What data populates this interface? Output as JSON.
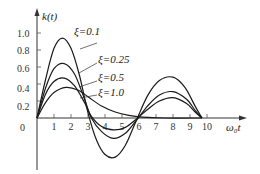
{
  "chart_data": {
    "type": "line",
    "title": "",
    "xlabel": "ω₀t",
    "ylabel": "k(t)",
    "xlim": [
      0,
      11.5
    ],
    "ylim": [
      -0.6,
      1.2
    ],
    "grid": false,
    "legend": "inline labels",
    "x_ticks": [
      "1",
      "2",
      "3",
      "4",
      "5",
      "6",
      "7",
      "8",
      "9",
      "10"
    ],
    "y_ticks": [
      "0.2",
      "0.4",
      "0.6",
      "0.8",
      "1.0"
    ],
    "origin_label": "0",
    "series": [
      {
        "name": "ξ=0.1",
        "points": [
          [
            0,
            0
          ],
          [
            0.5,
            0.45
          ],
          [
            1.0,
            0.82
          ],
          [
            1.5,
            0.94
          ],
          [
            2.0,
            0.82
          ],
          [
            2.5,
            0.5
          ],
          [
            3.0,
            0.06
          ],
          [
            3.5,
            -0.26
          ],
          [
            4.0,
            -0.43
          ],
          [
            4.6,
            -0.46
          ],
          [
            5.2,
            -0.32
          ],
          [
            5.8,
            -0.05
          ],
          [
            6.5,
            0.26
          ],
          [
            7.2,
            0.44
          ],
          [
            8.0,
            0.48
          ],
          [
            8.7,
            0.36
          ],
          [
            9.3,
            0.14
          ],
          [
            9.7,
            0.0
          ]
        ]
      },
      {
        "name": "ξ=0.25",
        "points": [
          [
            0,
            0
          ],
          [
            0.5,
            0.35
          ],
          [
            1.0,
            0.58
          ],
          [
            1.6,
            0.64
          ],
          [
            2.2,
            0.52
          ],
          [
            2.8,
            0.22
          ],
          [
            3.2,
            0.0
          ],
          [
            3.8,
            -0.16
          ],
          [
            4.5,
            -0.24
          ],
          [
            5.2,
            -0.18
          ],
          [
            5.8,
            -0.04
          ],
          [
            6.5,
            0.14
          ],
          [
            7.2,
            0.27
          ],
          [
            8.0,
            0.31
          ],
          [
            8.8,
            0.22
          ],
          [
            9.3,
            0.09
          ],
          [
            9.7,
            0.0
          ]
        ]
      },
      {
        "name": "ξ=0.5",
        "points": [
          [
            0,
            0
          ],
          [
            0.5,
            0.28
          ],
          [
            1.0,
            0.43
          ],
          [
            1.6,
            0.47
          ],
          [
            2.2,
            0.38
          ],
          [
            2.8,
            0.18
          ],
          [
            3.2,
            0.02
          ],
          [
            3.8,
            -0.1
          ],
          [
            4.5,
            -0.14
          ],
          [
            5.2,
            -0.11
          ],
          [
            5.8,
            -0.02
          ],
          [
            6.5,
            0.1
          ],
          [
            7.2,
            0.2
          ],
          [
            8.0,
            0.24
          ],
          [
            8.8,
            0.17
          ],
          [
            9.3,
            0.07
          ],
          [
            9.7,
            0.0
          ]
        ]
      },
      {
        "name": "ξ=1.0",
        "points": [
          [
            0,
            0
          ],
          [
            0.5,
            0.18
          ],
          [
            1.0,
            0.3
          ],
          [
            1.7,
            0.36
          ],
          [
            2.4,
            0.33
          ],
          [
            3.0,
            0.25
          ],
          [
            3.8,
            0.14
          ],
          [
            4.6,
            0.07
          ],
          [
            5.4,
            0.03
          ],
          [
            6.2,
            0.01
          ],
          [
            7.5,
            0.0
          ],
          [
            9.7,
            0.0
          ]
        ]
      }
    ]
  },
  "labels": {
    "y_axis_title": "k(t)",
    "x_axis_title": "ω₀t",
    "origin": "0",
    "y_ticks": [
      "1.0",
      "0.8",
      "0.6",
      "0.4",
      "0.2"
    ],
    "x_ticks": [
      "1",
      "2",
      "3",
      "4",
      "5",
      "6",
      "7",
      "8",
      "9",
      "10"
    ],
    "curves": [
      "ξ=0.1",
      "ξ=0.25",
      "ξ=0.5",
      "ξ=1.0"
    ]
  },
  "colors": {
    "line": "#1a1a1a",
    "axis": "#333333"
  }
}
